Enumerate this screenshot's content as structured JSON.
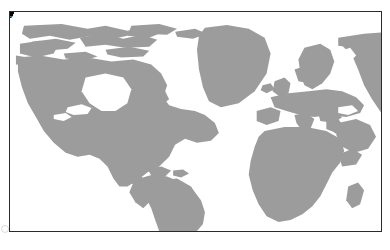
{
  "figure": {
    "kind": "world-map",
    "projection_note": "equirectangular world map, gray landmasses on white ocean",
    "frame": {
      "border_color": "#2b2b2b",
      "background_color": "#ffffff"
    },
    "colors": {
      "land": "#9c9c9c",
      "ocean": "#ffffff",
      "marker": "#000000",
      "label": "#000000",
      "border": "#2b2b2b"
    }
  },
  "watermark": {
    "text": "",
    "visible": true
  },
  "map_points": [
    {
      "id": "a",
      "label": "a",
      "dot_x_pct": 6.0,
      "dot_y_pct": 30.3,
      "label_x_pct": 3.7,
      "label_y_pct": 26.2
    },
    {
      "id": "b",
      "label": "b",
      "dot_x_pct": 16.1,
      "dot_y_pct": 41.2,
      "label_x_pct": 13.5,
      "label_y_pct": 36.7
    },
    {
      "id": "c",
      "label": "c",
      "dot_x_pct": 20.4,
      "dot_y_pct": 41.6,
      "label_x_pct": 20.0,
      "label_y_pct": 47.5
    },
    {
      "id": "d",
      "label": "d",
      "dot_x_pct": 22.5,
      "dot_y_pct": 37.1,
      "label_x_pct": 20.4,
      "label_y_pct": 31.8
    },
    {
      "id": "e",
      "label": "e",
      "dot_x_pct": 27.2,
      "dot_y_pct": 85.0,
      "label_x_pct": 25.5,
      "label_y_pct": 80.3
    },
    {
      "id": "f",
      "label": "f",
      "dot_x_pct": 52.3,
      "dot_y_pct": 28.1,
      "label_x_pct": 52.3,
      "label_y_pct": 22.2
    },
    {
      "id": "g",
      "label": "g",
      "dot_x_pct": 56.7,
      "dot_y_pct": 90.5,
      "label_x_pct": 54.4,
      "label_y_pct": 87.8
    },
    {
      "id": "h",
      "label": "h",
      "dot_x_pct": 62.6,
      "dot_y_pct": 32.2,
      "label_x_pct": 60.1,
      "label_y_pct": 28.5
    },
    {
      "id": "i",
      "label": "i",
      "dot_x_pct": 70.2,
      "dot_y_pct": 22.3,
      "label_x_pct": 70.6,
      "label_y_pct": 28.1
    },
    {
      "id": "j",
      "label": "j",
      "dot_x_pct": 90.3,
      "dot_y_pct": 17.8,
      "label_x_pct": 91.1,
      "label_y_pct": 23.9
    }
  ]
}
